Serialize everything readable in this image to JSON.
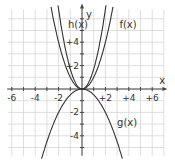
{
  "chart_data": {
    "type": "line",
    "title": "",
    "xlabel": "x",
    "ylabel": "y",
    "xlim": [
      -6.2,
      6.8
    ],
    "ylim": [
      -5.7,
      6.8
    ],
    "grid": true,
    "x_tick_labels": [
      "-6",
      "-4",
      "-2",
      "+2",
      "+4",
      "+6"
    ],
    "y_tick_labels": [
      "+4",
      "+2",
      "-2",
      "-4"
    ],
    "series": [
      {
        "name": "f(x)",
        "formula": "x^2",
        "coef": 1.0
      },
      {
        "name": "h(x)",
        "formula": "~1.7x^2",
        "coef": 1.7
      },
      {
        "name": "g(x)",
        "formula": "-0.5x^2",
        "coef": -0.5
      }
    ],
    "annotations": [
      {
        "text": "f(x)",
        "x": 3.2,
        "y": 5.2
      },
      {
        "text": "h(x)",
        "x": -1.2,
        "y": 5.2
      },
      {
        "text": "g(x)",
        "x": 3.0,
        "y": -3.2
      }
    ]
  }
}
